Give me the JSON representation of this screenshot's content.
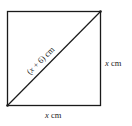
{
  "diagram": {
    "type": "square-with-diagonal",
    "diagonal_label": {
      "open": "(",
      "var": "x",
      "rest": " + 6) cm"
    },
    "right_side_label": {
      "var": "x",
      "unit": " cm"
    },
    "bottom_side_label": {
      "var": "x",
      "unit": " cm"
    },
    "colors": {
      "stroke": "#1a1a1a",
      "text": "#222222",
      "background": "#ffffff"
    }
  }
}
